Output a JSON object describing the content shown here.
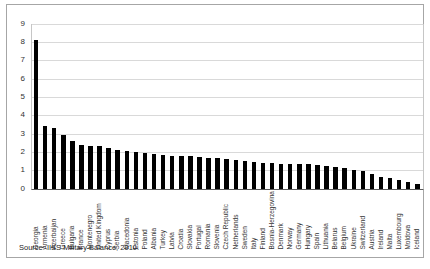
{
  "source_note": "Source: IISS Military Balance, 2010.",
  "colors": {
    "bar": "#000000",
    "gridline": "#d9d9d9",
    "axis_line": "#c6c6c6",
    "baseline": "#595959",
    "border": "#a6a6a6",
    "text": "#333333"
  },
  "chart_data": {
    "type": "bar",
    "title": "",
    "xlabel": "",
    "ylabel": "",
    "ylim": [
      0,
      9
    ],
    "yticks": [
      0,
      1,
      2,
      3,
      4,
      5,
      6,
      7,
      8,
      9
    ],
    "grid": true,
    "legend": "none",
    "categories": [
      "Georgia",
      "Armenia",
      "Azerbaijan",
      "Greece",
      "Bulgaria",
      "France",
      "Montenegro",
      "United Kingdom",
      "Cyprus",
      "Serbia",
      "Macedonia",
      "Estonia",
      "Poland",
      "Albania",
      "Turkey",
      "Latvia",
      "Croatia",
      "Slovakia",
      "Portugal",
      "Romania",
      "Slovenia",
      "Czech Republic",
      "Netherlands",
      "Sweden",
      "Italy",
      "Finland",
      "Bosnia-Herzegovina",
      "Denmark",
      "Norway",
      "Germany",
      "Hungary",
      "Spain",
      "Lithuania",
      "Belarus",
      "Belgium",
      "Ukraine",
      "Switzerland",
      "Austria",
      "Ireland",
      "Malta",
      "Luxembourg",
      "Moldova",
      "Iceland"
    ],
    "values": [
      8.1,
      3.4,
      3.3,
      2.9,
      2.6,
      2.35,
      2.3,
      2.3,
      2.2,
      2.1,
      2.05,
      2.0,
      1.95,
      1.9,
      1.85,
      1.8,
      1.75,
      1.75,
      1.7,
      1.65,
      1.65,
      1.6,
      1.55,
      1.5,
      1.45,
      1.4,
      1.4,
      1.35,
      1.35,
      1.35,
      1.35,
      1.3,
      1.25,
      1.2,
      1.1,
      1.0,
      0.95,
      0.8,
      0.65,
      0.6,
      0.45,
      0.35,
      0.25
    ]
  }
}
